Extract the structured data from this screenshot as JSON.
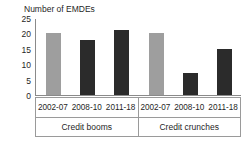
{
  "chart_data": {
    "type": "bar",
    "title": "Number of EMDEs",
    "xlabel": "",
    "ylabel": "Number of EMDEs",
    "ylim": [
      0,
      25
    ],
    "yticks": [
      25,
      20,
      15,
      10,
      5,
      0
    ],
    "grid": false,
    "legend": "none",
    "categories": [
      "2002-07",
      "2008-10",
      "2011-18"
    ],
    "groups": [
      {
        "name": "Credit booms",
        "bars": [
          {
            "category": "2002-07",
            "value": 20,
            "color": "#9e9e9e"
          },
          {
            "category": "2008-10",
            "value": 18,
            "color": "#2b2b2b"
          },
          {
            "category": "2011-18",
            "value": 21,
            "color": "#2b2b2b"
          }
        ]
      },
      {
        "name": "Credit crunches",
        "bars": [
          {
            "category": "2002-07",
            "value": 20,
            "color": "#9e9e9e"
          },
          {
            "category": "2008-10",
            "value": 7,
            "color": "#2b2b2b"
          },
          {
            "category": "2011-18",
            "value": 15,
            "color": "#2b2b2b"
          }
        ]
      }
    ],
    "colors": {
      "series_light": "#9e9e9e",
      "series_dark": "#2b2b2b",
      "axis": "#8a8a8a",
      "text": "#1f1f1f",
      "background": "#ffffff"
    }
  }
}
